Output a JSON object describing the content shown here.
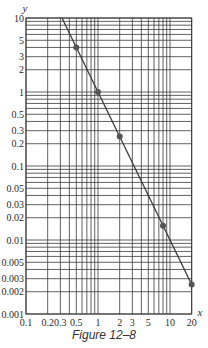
{
  "caption": "Figure 12–8",
  "chart_data": {
    "type": "line",
    "title": "",
    "xlabel": "x",
    "ylabel": "y",
    "xscale": "log",
    "yscale": "log",
    "xlim": [
      0.1,
      20
    ],
    "ylim": [
      0.001,
      10
    ],
    "grid": true,
    "legend": null,
    "x_ticks": [
      0.1,
      0.2,
      0.3,
      0.5,
      1,
      2,
      3,
      5,
      10,
      20
    ],
    "x_tick_labels": [
      "0.1",
      "0.2",
      "0.3",
      "0.5",
      "1",
      "2",
      "3",
      "5",
      "10",
      "20"
    ],
    "y_ticks": [
      10,
      5,
      3,
      2,
      1,
      0.5,
      0.3,
      0.2,
      0.1,
      0.05,
      0.03,
      0.02,
      0.01,
      0.005,
      0.003,
      0.002,
      0.001
    ],
    "y_tick_labels": [
      "10",
      "5",
      "3",
      "2",
      "1",
      "0.5",
      "0.3",
      "0.2",
      "0.1",
      "0.05",
      "0.03",
      "0.02",
      "0.01",
      "0.005",
      "0.003",
      "0.002",
      "0.001"
    ],
    "series": [
      {
        "name": "y = 1/x^2",
        "line": {
          "x": [
            0.3162,
            20
          ],
          "y": [
            10,
            0.0025
          ]
        },
        "points": {
          "x": [
            0.5,
            1,
            2,
            8,
            20
          ],
          "y": [
            4,
            1,
            0.25,
            0.015625,
            0.0025
          ]
        }
      }
    ],
    "colors": {
      "grid": "#3a3a3a",
      "line": "#3a3a3a",
      "marker": "#555555",
      "text": "#2a2a2a"
    }
  }
}
